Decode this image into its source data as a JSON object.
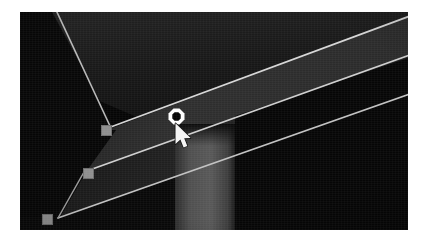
{
  "scene": {
    "title": "3D viewport",
    "description": "Dark shaded 3D viewport showing a selected spline / edge path drawn across two large shaded faces, with square vertex handles, one highlighted octagonal vertex handle and the mouse pointer.",
    "background_color": "#000000",
    "frame_color": "#ffffff",
    "canvas": {
      "x": 20,
      "y": 12,
      "width": 388,
      "height": 218
    }
  },
  "surfaces": [
    {
      "name": "upper-face",
      "label": "Upper shaded face",
      "fill": "#1b1b1b",
      "points": "0,0 388,0 388,44 150,118 42,74"
    },
    {
      "name": "mid-band-face",
      "label": "Middle diagonal band",
      "fill": "#272727",
      "points": "50,128 388,6 388,52 168,128 112,160"
    },
    {
      "name": "lower-band-face",
      "label": "Lower diagonal band",
      "fill": "#1e1e1e",
      "points": "30,200 388,62 388,110 60,210"
    },
    {
      "name": "right-column",
      "label": "Vertical lit column",
      "fill": "#4a4a4a",
      "x": 155,
      "y": 118,
      "width": 60,
      "height": 100
    },
    {
      "name": "right-dark-wall",
      "label": "Right dark wall",
      "fill": "#0a0a0a",
      "x": 215,
      "y": 110,
      "width": 173,
      "height": 108
    }
  ],
  "edges": [
    {
      "name": "edge-top-left-diagonal",
      "label": "Top-left silhouette edge",
      "color": "#c9c9c9",
      "x1": 38,
      "y1": 12,
      "x2": 92,
      "y2": 113
    },
    {
      "name": "edge-selected-upper",
      "label": "Selected path upper rail",
      "color": "#d8d8d8",
      "x1": 92,
      "y1": 115,
      "x2": 388,
      "y2": 6
    },
    {
      "name": "edge-selected-mid",
      "label": "Selected path mid rail",
      "color": "#d0d0d0",
      "x1": 66,
      "y1": 160,
      "x2": 388,
      "y2": 44
    },
    {
      "name": "edge-selected-lower",
      "label": "Selected path lower rail",
      "color": "#cacaca",
      "x1": 40,
      "y1": 205,
      "x2": 388,
      "y2": 80
    },
    {
      "name": "edge-left-riser-a",
      "label": "Left riser segment",
      "color": "#8a8a8a",
      "x1": 66,
      "y1": 160,
      "x2": 40,
      "y2": 205
    }
  ],
  "vertex_handles": [
    {
      "name": "vertex-handle-1",
      "label": "Vertex handle 1",
      "x": 81,
      "y": 113,
      "color": "#8e8e8e"
    },
    {
      "name": "vertex-handle-2",
      "label": "Vertex handle 2",
      "x": 63,
      "y": 156,
      "color": "#8e8e8e"
    },
    {
      "name": "vertex-handle-3",
      "label": "Vertex handle 3",
      "x": 22,
      "y": 202,
      "color": "#8e8e8e"
    }
  ],
  "active_vertex": {
    "name": "active-vertex-handle",
    "label": "Active (hovered) vertex handle",
    "shape": "octagon-ring",
    "x": 148,
    "y": 96,
    "ring_color": "#ffffff",
    "center_color": "#050505"
  },
  "cursor": {
    "name": "mouse-cursor",
    "label": "Mouse pointer (arrow)",
    "type": "arrow",
    "x": 154,
    "y": 112,
    "fill": "#f2f2f2",
    "outline": "#101010"
  }
}
